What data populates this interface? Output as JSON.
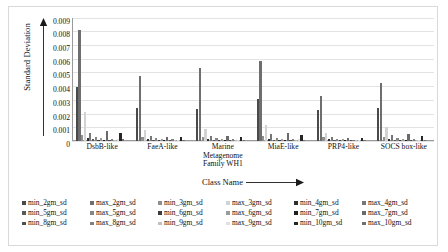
{
  "chart_data": {
    "type": "bar",
    "title": "",
    "subtitle": "",
    "xlabel": "Class Name",
    "ylabel": "Standard Deviation",
    "ylim": [
      0,
      0.009
    ],
    "ytick_labels": [
      "0.009",
      "0.008",
      "0.007",
      "0.006",
      "0.005",
      "0.004",
      "0.003",
      "0.002",
      "0.001",
      "0"
    ],
    "ytick_values": [
      0.009,
      0.008,
      0.007,
      0.006,
      0.005,
      0.004,
      0.003,
      0.002,
      0.001,
      0
    ],
    "grid": true,
    "legend_position": "bottom",
    "categories": [
      "DsbB-like",
      "FaeA-like",
      "Marine Metagenome Family WH1",
      "MiaE-like",
      "PRP4-like",
      "SOCS box-like"
    ],
    "series": [
      {
        "name": "min_2gm_sd",
        "color": "#4a4a4a",
        "values": [
          0.0039,
          0.0024,
          0.00235,
          0.00305,
          0.00225,
          0.0024
        ]
      },
      {
        "name": "max_2gm_sd",
        "color": "#6e6e6e",
        "values": [
          0.0081,
          0.00475,
          0.0053,
          0.00585,
          0.0033,
          0.0042
        ]
      },
      {
        "name": "min_3gm_sd",
        "color": "#8f8f8f",
        "values": [
          0.00042,
          0.0003,
          0.0003,
          0.00038,
          0.00028,
          0.0003
        ]
      },
      {
        "name": "max_3gm_sd",
        "color": "#d3d3d3",
        "values": [
          0.00215,
          0.0008,
          0.0009,
          0.00115,
          0.00055,
          0.00105
        ]
      },
      {
        "name": "min_4gm_sd",
        "color": "#2e2e2e",
        "values": [
          0.00022,
          0.00016,
          0.00016,
          0.00018,
          0.00014,
          0.00016
        ]
      },
      {
        "name": "max_4gm_sd",
        "color": "#777777",
        "values": [
          0.0006,
          0.0004,
          0.0004,
          0.00048,
          0.0003,
          0.00042
        ]
      },
      {
        "name": "min_5gm_sd",
        "color": "#5a5a5a",
        "values": [
          0.00012,
          0.0001,
          0.0001,
          0.00011,
          9e-05,
          0.0001
        ]
      },
      {
        "name": "max_5gm_sd",
        "color": "#858585",
        "values": [
          0.0003,
          0.00022,
          0.00022,
          0.00025,
          0.00018,
          0.00022
        ]
      },
      {
        "name": "min_6gm_sd",
        "color": "#3c3c3c",
        "values": [
          8e-05,
          7e-05,
          7e-05,
          8e-05,
          6e-05,
          7e-05
        ]
      },
      {
        "name": "max_6gm_sd",
        "color": "#9b9b9b",
        "values": [
          0.00022,
          0.00016,
          0.00016,
          0.00018,
          0.00013,
          0.00016
        ]
      },
      {
        "name": "min_7gm_sd",
        "color": "#1f1f1f",
        "values": [
          6e-05,
          5e-05,
          5e-05,
          6e-05,
          5e-05,
          5e-05
        ]
      },
      {
        "name": "max_7gm_sd",
        "color": "#6a6a6a",
        "values": [
          0.0007,
          0.0003,
          0.0004,
          0.00055,
          0.00022,
          0.00048
        ]
      },
      {
        "name": "min_8gm_sd",
        "color": "#4f4f4f",
        "values": [
          5e-05,
          4e-05,
          4e-05,
          5e-05,
          4e-05,
          4e-05
        ]
      },
      {
        "name": "max_8gm_sd",
        "color": "#808080",
        "values": [
          0.00018,
          0.00013,
          0.00013,
          0.00015,
          0.00011,
          0.00013
        ]
      },
      {
        "name": "min_9gm_sd",
        "color": "#c0c0c0",
        "values": [
          4e-05,
          3e-05,
          3e-05,
          4e-05,
          3e-05,
          3e-05
        ]
      },
      {
        "name": "max_9gm_sd",
        "color": "#e0e0e0",
        "values": [
          0.00014,
          0.0001,
          0.0001,
          0.00012,
          8e-05,
          0.0001
        ]
      },
      {
        "name": "min_10gm_sd",
        "color": "#262626",
        "values": [
          0.00055,
          0.00028,
          0.0003,
          0.00042,
          0.0002,
          0.00038
        ]
      },
      {
        "name": "max_10gm_sd",
        "color": "#707070",
        "values": [
          0.00012,
          9e-05,
          9e-05,
          0.0001,
          8e-05,
          9e-05
        ]
      }
    ]
  },
  "axis": {
    "y_arrow_name": "y-axis-arrow",
    "x_arrow_name": "x-axis-arrow"
  }
}
